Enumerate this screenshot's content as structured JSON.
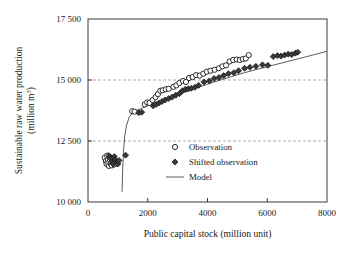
{
  "chart_data": {
    "type": "scatter",
    "title": "",
    "xlabel": "Public capital stock (million unit)",
    "ylabel_line1": "Sustainable raw water production",
    "ylabel_line2": "(million m",
    "ylabel_line2_sup": "3",
    "ylabel_line2_end": ")",
    "xlim": [
      0,
      8000
    ],
    "ylim": [
      10000,
      17500
    ],
    "xticks": [
      0,
      2000,
      4000,
      6000,
      8000
    ],
    "xtick_labels": [
      "0",
      "2000",
      "4000",
      "6000",
      "8000"
    ],
    "yticks": [
      10000,
      12500,
      15000,
      17500
    ],
    "ytick_labels": [
      "10 000",
      "12 500",
      "15 000",
      "17 500"
    ],
    "grid": "horizontal-dashed-at-12500-and-15000",
    "legend_position": "center-right-inside",
    "series": [
      {
        "name": "Observation",
        "marker": "open-circle",
        "color": "#ffffff",
        "edge_color": "#2b2b2b",
        "points": [
          [
            560,
            11820
          ],
          [
            600,
            11680
          ],
          [
            620,
            11560
          ],
          [
            640,
            11900
          ],
          [
            660,
            11720
          ],
          [
            680,
            11600
          ],
          [
            700,
            11480
          ],
          [
            720,
            11850
          ],
          [
            740,
            11700
          ],
          [
            760,
            11560
          ],
          [
            780,
            11620
          ],
          [
            800,
            11500
          ],
          [
            820,
            11760
          ],
          [
            850,
            11620
          ],
          [
            880,
            11540
          ],
          [
            900,
            11700
          ],
          [
            930,
            11580
          ],
          [
            960,
            11640
          ],
          [
            1480,
            13720
          ],
          [
            1560,
            13700
          ],
          [
            1900,
            14000
          ],
          [
            1980,
            14080
          ],
          [
            2060,
            14060
          ],
          [
            2160,
            14180
          ],
          [
            2260,
            14300
          ],
          [
            2340,
            14420
          ],
          [
            2420,
            14560
          ],
          [
            2500,
            14580
          ],
          [
            2600,
            14620
          ],
          [
            2700,
            14640
          ],
          [
            2860,
            14720
          ],
          [
            2960,
            14780
          ],
          [
            3060,
            14880
          ],
          [
            3180,
            14960
          ],
          [
            3280,
            14920
          ],
          [
            3380,
            15080
          ],
          [
            3500,
            15120
          ],
          [
            3620,
            15200
          ],
          [
            3740,
            15180
          ],
          [
            3860,
            15260
          ],
          [
            3980,
            15340
          ],
          [
            4100,
            15380
          ],
          [
            4240,
            15420
          ],
          [
            4380,
            15480
          ],
          [
            4500,
            15560
          ],
          [
            4620,
            15600
          ],
          [
            4740,
            15760
          ],
          [
            4860,
            15820
          ],
          [
            4980,
            15840
          ],
          [
            5080,
            15820
          ],
          [
            5180,
            15860
          ],
          [
            5280,
            15880
          ],
          [
            5380,
            16020
          ]
        ]
      },
      {
        "name": "Shifted observation",
        "marker": "filled-diamond",
        "color": "#3a3a3a",
        "points": [
          [
            700,
            11900
          ],
          [
            760,
            11780
          ],
          [
            800,
            11660
          ],
          [
            840,
            11560
          ],
          [
            880,
            11860
          ],
          [
            920,
            11720
          ],
          [
            960,
            11620
          ],
          [
            1000,
            11560
          ],
          [
            1040,
            11700
          ],
          [
            1260,
            11920
          ],
          [
            1700,
            13660
          ],
          [
            1800,
            13680
          ],
          [
            2180,
            13940
          ],
          [
            2280,
            14000
          ],
          [
            2380,
            14060
          ],
          [
            2480,
            14120
          ],
          [
            2580,
            14180
          ],
          [
            2700,
            14240
          ],
          [
            2820,
            14300
          ],
          [
            2940,
            14380
          ],
          [
            3060,
            14440
          ],
          [
            3160,
            14560
          ],
          [
            3260,
            14620
          ],
          [
            3360,
            14640
          ],
          [
            3460,
            14660
          ],
          [
            3580,
            14700
          ],
          [
            3700,
            14780
          ],
          [
            3880,
            14920
          ],
          [
            4060,
            14960
          ],
          [
            4220,
            15060
          ],
          [
            4380,
            15100
          ],
          [
            4540,
            15180
          ],
          [
            4700,
            15260
          ],
          [
            4880,
            15300
          ],
          [
            5040,
            15380
          ],
          [
            5240,
            15480
          ],
          [
            5420,
            15520
          ],
          [
            5620,
            15560
          ],
          [
            5840,
            15620
          ],
          [
            6020,
            15600
          ],
          [
            6200,
            15960
          ],
          [
            6340,
            16000
          ],
          [
            6460,
            15980
          ],
          [
            6580,
            16020
          ],
          [
            6700,
            16060
          ],
          [
            6820,
            16040
          ],
          [
            6940,
            16100
          ],
          [
            7020,
            16140
          ]
        ]
      }
    ],
    "model_line": {
      "name": "Model",
      "color": "#5a5a5a",
      "points": [
        [
          1140,
          10420
        ],
        [
          1160,
          11300
        ],
        [
          1190,
          12100
        ],
        [
          1230,
          12700
        ],
        [
          1290,
          13150
        ],
        [
          1380,
          13480
        ],
        [
          1500,
          13660
        ],
        [
          1640,
          13760
        ],
        [
          1820,
          13850
        ],
        [
          2040,
          13960
        ],
        [
          2300,
          14080
        ],
        [
          2580,
          14210
        ],
        [
          2900,
          14350
        ],
        [
          3240,
          14500
        ],
        [
          3600,
          14660
        ],
        [
          3980,
          14820
        ],
        [
          4380,
          14980
        ],
        [
          4800,
          15140
        ],
        [
          5240,
          15300
        ],
        [
          5700,
          15450
        ],
        [
          6180,
          15600
        ],
        [
          6680,
          15760
        ],
        [
          7200,
          15920
        ],
        [
          7700,
          16080
        ],
        [
          8000,
          16180
        ]
      ]
    },
    "legend_items": [
      {
        "label": "Observation",
        "marker": "open-circle"
      },
      {
        "label": "Shifted observation",
        "marker": "filled-diamond"
      },
      {
        "label": "Model",
        "marker": "line"
      }
    ]
  }
}
